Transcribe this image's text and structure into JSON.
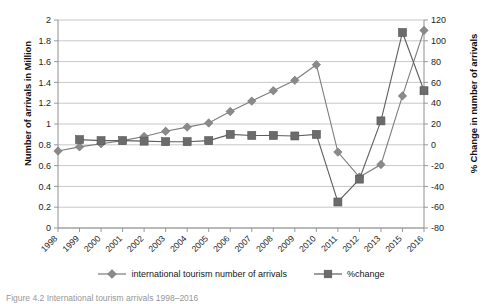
{
  "chart_data": {
    "type": "line",
    "title": "",
    "xlabel": "",
    "grid": true,
    "legend_position": "bottom",
    "categories": [
      "1998",
      "1999",
      "2000",
      "2001",
      "2002",
      "2003",
      "2004",
      "2005",
      "2006",
      "2007",
      "2008",
      "2009",
      "2010",
      "2011",
      "2012",
      "2013",
      "2015",
      "2016"
    ],
    "axes": {
      "left": {
        "label": "Number of arrivals in Million",
        "min": 0,
        "max": 2,
        "step": 0.2,
        "ticks": [
          "0",
          "0.2",
          "0.4",
          "0.6",
          "0.8",
          "1",
          "1.2",
          "1.4",
          "1.6",
          "1.8",
          "2"
        ]
      },
      "right": {
        "label": "% Change in number of arrivals",
        "min": -80,
        "max": 120,
        "step": 20,
        "ticks": [
          "-80",
          "-60",
          "-40",
          "-20",
          "0",
          "20",
          "40",
          "60",
          "80",
          "100",
          "120"
        ]
      }
    },
    "series": [
      {
        "name": "international tourism number of arrivals",
        "axis": "left",
        "marker": "diamond",
        "color": "#8a8a8a",
        "values": [
          0.74,
          0.78,
          0.81,
          0.84,
          0.88,
          0.93,
          0.97,
          1.01,
          1.12,
          1.22,
          1.32,
          1.42,
          1.57,
          0.73,
          0.49,
          0.61,
          1.27,
          1.9
        ]
      },
      {
        "name": "%change",
        "axis": "right",
        "marker": "square",
        "color": "#6b6b6b",
        "values": [
          null,
          5,
          4,
          4,
          3.5,
          3,
          3,
          4,
          10,
          9,
          9,
          8.5,
          10,
          -55,
          -33,
          23,
          108,
          52
        ]
      }
    ]
  },
  "legend": {
    "items": [
      {
        "label": "international tourism number of arrivals"
      },
      {
        "label": "%change"
      }
    ]
  },
  "caption": {
    "text": "Figure 4.2 International tourism arrivals 1998–2016"
  }
}
